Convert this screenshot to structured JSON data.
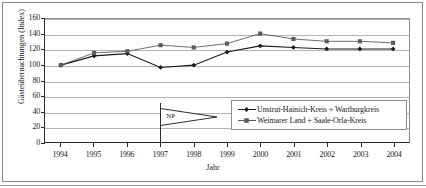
{
  "chart_data": {
    "type": "line",
    "title": "",
    "xlabel": "Jahr",
    "ylabel": "Gästeübernachtungen (Index)",
    "categories": [
      "1994",
      "1995",
      "1996",
      "1997",
      "1998",
      "1999",
      "2000",
      "2001",
      "2002",
      "2003",
      "2004"
    ],
    "x": [
      1994,
      1995,
      1996,
      1997,
      1998,
      1999,
      2000,
      2001,
      2002,
      2003,
      2004
    ],
    "ylim": [
      0,
      160
    ],
    "ytick_values": [
      0,
      20,
      40,
      60,
      80,
      100,
      120,
      140,
      160
    ],
    "ytick_labels": [
      "0",
      "20",
      "40",
      "60",
      "80",
      "100",
      "120",
      "140",
      "160"
    ],
    "grid": true,
    "legend_position": "inside-lower-right",
    "series": [
      {
        "name": "Unstrut-Hainich-Kreis + Wartburgkreis",
        "marker": "diamond",
        "color": "#1a1a1a",
        "values": [
          100,
          112,
          115,
          97,
          100,
          117,
          125,
          123,
          121,
          121,
          121
        ]
      },
      {
        "name": "Weimarer Land + Saale-Orla-Kreis",
        "marker": "square",
        "color": "#5a5a5a",
        "values": [
          100,
          116,
          118,
          126,
          123,
          128,
          141,
          134,
          131,
          131,
          129
        ]
      }
    ],
    "annotations": [
      {
        "id": "np-flag",
        "label": "NP",
        "at_category": "1997",
        "shape": "pennant-flag",
        "description": "Vertical pole with right-pointing triangular pennant labelled NP at year 1997"
      }
    ]
  },
  "axes": {
    "y_axis_title": "Gästeübernachtungen (Index)",
    "x_axis_title": "Jahr"
  },
  "legend": {
    "items": [
      {
        "label": "Unstrut-Hainich-Kreis + Wartburgkreis",
        "marker": "diamond",
        "color": "#1a1a1a"
      },
      {
        "label": "Weimarer Land + Saale-Orla-Kreis",
        "marker": "square",
        "color": "#5a5a5a"
      }
    ]
  },
  "colors": {
    "series1": "#1a1a1a",
    "series2": "#5a5a5a",
    "gridline": "#b4b4b4",
    "axis": "#2b2b2b",
    "frame": "#8a8a8a",
    "background": "#ffffff"
  }
}
